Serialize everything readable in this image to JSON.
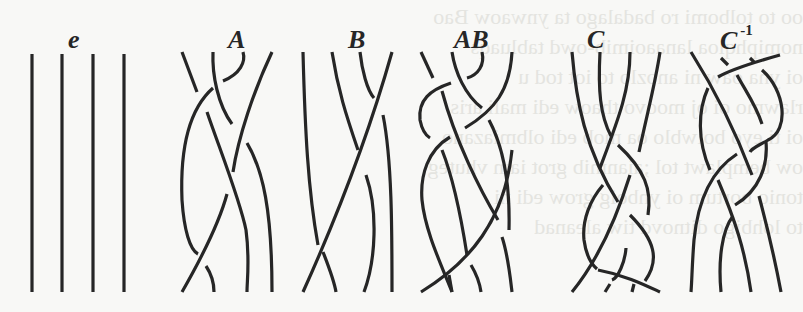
{
  "figure": {
    "background_text_lines": [
      "oo to tolbomi ro badalago ta ynwaow Bao",
      "nomiphqioa lanaaoimib-owd tabluaqs",
      "oi yna oaw ni anozlo to iot tod u",
      "rlawmo oi oj moovo thaow edi mali aris",
      "oi ti eyo boiwblo oa mob edi olbmiazano",
      "ow bemplawt tol ;aianmib grot iam vhuteg",
      "tonio bortum oi ynboig grow edi ni",
      "to lohbigo ditnovd tiw aleanad"
    ],
    "stroke_color": "#262626",
    "braids": [
      {
        "id": "e",
        "label": "e",
        "superscript": "",
        "label_x": 68,
        "label_y": 27,
        "paths": [
          "M32 54 L32 292",
          "M62 54 L62 292",
          "M93 54 L93 292",
          "M124 54 L124 292"
        ]
      },
      {
        "id": "A",
        "label": "A",
        "superscript": "",
        "label_x": 228,
        "label_y": 27,
        "paths": [
          "M182 52 L197 92",
          "M213 52 C212 75 218 105 232 124",
          "M243 52 C246 62 240 74 223 81",
          "M272 52 C254 90 238 138 233 172",
          "M213 88 C188 110 180 150 182 200 C184 230 190 250 198 254",
          "M207 112 C220 150 240 200 246 230 C250 260 247 280 247 292",
          "M247 143 C263 170 272 210 272 292",
          "M227 194 C220 220 206 250 182 292",
          "M206 266 C212 275 214 285 214 292"
        ]
      },
      {
        "id": "B",
        "label": "B",
        "superscript": "",
        "label_x": 348,
        "label_y": 27,
        "paths": [
          "M303 52 C305 130 308 190 318 245",
          "M332 52 C338 90 346 115 358 150",
          "M360 52 C362 70 367 90 374 98",
          "M392 52 C370 130 340 210 303 292",
          "M383 115 C392 160 392 230 392 292",
          "M366 175 C378 210 376 260 364 292",
          "M323 252 C328 265 334 280 336 292"
        ]
      },
      {
        "id": "AB",
        "label": "AB",
        "superscript": "",
        "label_x": 454,
        "label_y": 27,
        "paths": [
          "M421 52 L433 78",
          "M452 52 C455 72 465 95 482 108",
          "M482 52 C485 65 478 75 467 78",
          "M512 52 C510 90 495 110 465 128",
          "M451 83 C430 90 418 100 420 120 C422 130 425 135 430 138",
          "M442 91 C455 140 480 190 498 220",
          "M489 120 C505 150 510 190 509 230",
          "M450 137 C428 150 420 175 422 200 C425 230 440 262 452 292",
          "M442 150 C452 175 460 210 467 255",
          "M512 150 C505 220 470 262 421 292",
          "M502 237 C508 255 510 275 512 292",
          "M471 265 C477 275 480 285 481 292",
          "M449 275 L452 292"
        ]
      },
      {
        "id": "C",
        "label": "C",
        "superscript": "",
        "label_x": 587,
        "label_y": 27,
        "paths": [
          "M572 52 C576 100 585 150 618 202",
          "M600 52 C598 90 600 115 611 136",
          "M630 52 C630 90 618 120 600 168",
          "M660 52 C656 80 648 110 639 152",
          "M618 145 C645 170 652 190 648 215",
          "M603 185 C590 200 582 220 584 240 C586 255 590 263 597 269",
          "M630 175 C616 220 598 260 572 292",
          "M630 215 C655 240 660 260 645 281",
          "M626 248 C625 262 618 278 612 280",
          "M598 270 C625 275 645 285 660 292",
          "M610 284 L605 292",
          "M634 284 L632 292"
        ]
      },
      {
        "id": "C_inv",
        "label": "C",
        "superscript": "-1",
        "label_x": 720,
        "label_y": 27,
        "paths": [
          "M691 52 C715 90 735 130 752 175",
          "M721 58 L728 65",
          "M750 58 L754 62",
          "M780 55 C755 62 730 70 718 77",
          "M737 75 C745 90 756 105 762 124",
          "M762 70 C785 90 790 130 768 140 C758 146 752 148 750 152",
          "M708 88 C698 110 697 140 710 170",
          "M737 154 C712 170 698 200 694 240 C692 265 692 280 691 292",
          "M766 142 C768 165 760 190 735 205",
          "M718 180 C735 220 745 250 751 292",
          "M733 216 C722 230 718 260 721 292",
          "M759 196 C768 230 775 260 781 292"
        ]
      }
    ]
  }
}
